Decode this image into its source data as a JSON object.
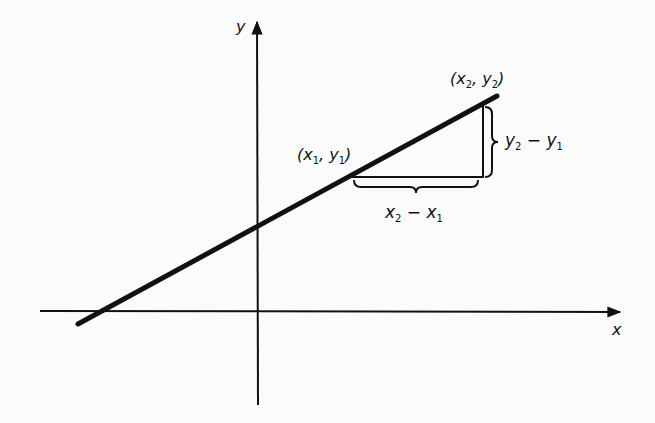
{
  "diagram": {
    "type": "slope-of-line",
    "axes": {
      "x_label": "x",
      "y_label": "y"
    },
    "points": {
      "p1": {
        "label": "(x₁, y₁)",
        "var_x": "x",
        "sub_x": "1",
        "var_y": "y",
        "sub_y": "1"
      },
      "p2": {
        "label": "(x₂, y₂)",
        "var_x": "x",
        "sub_x": "2",
        "var_y": "y",
        "sub_y": "2"
      }
    },
    "annotations": {
      "rise": {
        "label": "y₂ − y₁",
        "a": "y",
        "a_sub": "2",
        "op": "−",
        "b": "y",
        "b_sub": "1"
      },
      "run": {
        "label": "x₂ − x₁",
        "a": "x",
        "a_sub": "2",
        "op": "−",
        "b": "x",
        "b_sub": "1"
      }
    },
    "colors": {
      "ink": "#111111",
      "background": "#fbfbfb"
    }
  }
}
